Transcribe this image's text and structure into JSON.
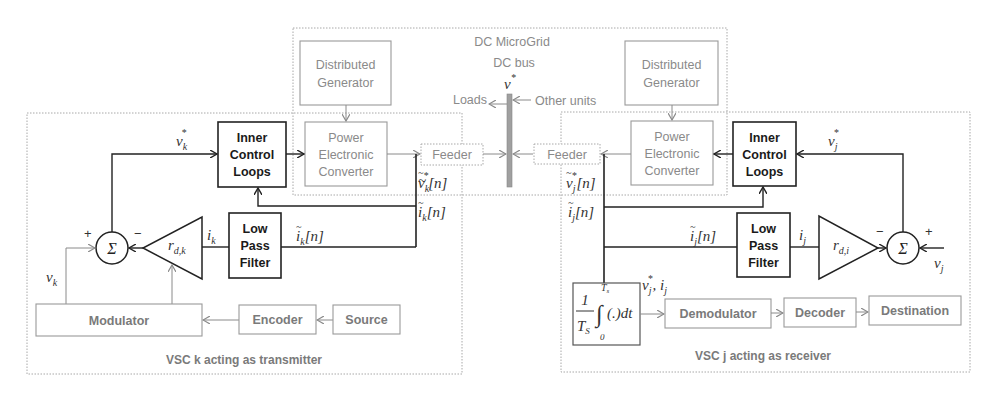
{
  "title": "DC MicroGrid",
  "bus": {
    "label": "DC bus",
    "voltage": "v",
    "voltage_sup": "*",
    "loads": "Loads",
    "other_units": "Other units"
  },
  "colors": {
    "solid": "#222222",
    "grey": "#8a8a8a",
    "dotted": "#a0a0a0",
    "bus": "#9a9a9a"
  },
  "left_unit": {
    "caption": "VSC k acting as transmitter",
    "distributed_generator": [
      "Distributed",
      "Generator"
    ],
    "power_converter": [
      "Power",
      "Electronic",
      "Converter"
    ],
    "feeder": "Feeder",
    "inner_control": [
      "Inner",
      "Control",
      "Loops"
    ],
    "low_pass_filter": [
      "Low",
      "Pass",
      "Filter"
    ],
    "modulator": "Modulator",
    "encoder": "Encoder",
    "source": "Source",
    "sum_symbol": "Σ",
    "plus": "+",
    "minus": "−",
    "gain": {
      "base": "r",
      "sub": "d,k"
    },
    "signals": {
      "v_ref": {
        "base": "v",
        "sub": "k",
        "sup": "*"
      },
      "v": {
        "base": "v",
        "sub": "k"
      },
      "i": {
        "base": "i",
        "sub": "k"
      },
      "v_sample": {
        "base": "v",
        "sub": "k",
        "sup": "*",
        "idx": "[n]"
      },
      "i_sample": {
        "base": "i",
        "sub": "k",
        "idx": "[n]"
      },
      "i_filtered": {
        "base": "i",
        "sub": "k",
        "idx": "[n]"
      }
    }
  },
  "right_unit": {
    "caption": "VSC j acting as receiver",
    "distributed_generator": [
      "Distributed",
      "Generator"
    ],
    "power_converter": [
      "Power",
      "Electronic",
      "Converter"
    ],
    "feeder": "Feeder",
    "inner_control": [
      "Inner",
      "Control",
      "Loops"
    ],
    "low_pass_filter": [
      "Low",
      "Pass",
      "Filter"
    ],
    "demodulator": "Demodulator",
    "decoder": "Decoder",
    "destination": "Destination",
    "sum_symbol": "Σ",
    "plus": "+",
    "minus": "−",
    "gain": {
      "base": "r",
      "sub": "d,i"
    },
    "integrator": {
      "num": "1",
      "den": "T",
      "den_sub": "S",
      "upper": "T",
      "upper_sub": "s",
      "lower": "0",
      "body": "(.)dt"
    },
    "signals": {
      "v_ref": {
        "base": "v",
        "sub": "j",
        "sup": "*"
      },
      "v": {
        "base": "v",
        "sub": "j"
      },
      "i": {
        "base": "i",
        "sub": "j"
      },
      "v_sample": {
        "base": "v",
        "sub": "j",
        "sup": "*",
        "idx": "[n]"
      },
      "i_sample": {
        "base": "i",
        "sub": "j",
        "idx": "[n]"
      },
      "i_filtered": {
        "base": "i",
        "sub": "j",
        "idx": "[n]"
      },
      "integrator_out": "v*j, ij"
    }
  }
}
